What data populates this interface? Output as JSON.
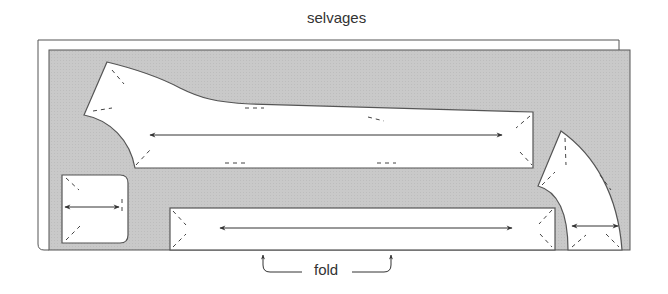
{
  "labels": {
    "top": "selvages",
    "bottom": "fold"
  },
  "colors": {
    "fabric": "#c8c8c8",
    "outline": "#555555",
    "piece_fill": "#ffffff",
    "text": "#333333"
  },
  "pattern_pieces": [
    {
      "name": "sleeve-shaped-piece",
      "grainline": "horizontal double arrow"
    },
    {
      "name": "small-square-piece",
      "grainline": "horizontal double arrow"
    },
    {
      "name": "long-rectangle-on-fold",
      "grainline": "horizontal double arrow"
    },
    {
      "name": "curved-facing-piece",
      "grainline": "horizontal double arrow"
    }
  ],
  "annotations": {
    "fold_arrows": "two arrows pointing up to fold line"
  }
}
